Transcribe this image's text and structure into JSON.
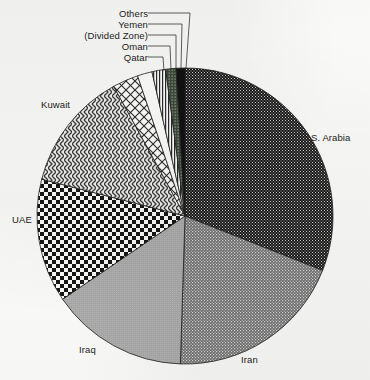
{
  "chart_data": {
    "type": "pie",
    "title": "",
    "subtitle": "",
    "xlabel": "",
    "ylabel": "",
    "legend_position": "none",
    "grid": false,
    "categories": [
      "S. Arabia",
      "Iran",
      "Iraq",
      "UAE",
      "Kuwait",
      "Qatar",
      "Oman",
      "(Divided Zone)",
      "Yemen",
      "Others"
    ],
    "values": [
      31.0,
      19.5,
      15.0,
      13.5,
      13.0,
      2.8,
      1.6,
      1.5,
      1.1,
      1.0
    ],
    "unit": "percent",
    "slices": [
      {
        "label": "S. Arabia",
        "value": 31.0,
        "start_angle": 0.0,
        "end_angle": 111.6,
        "fill": "black-fine-dot",
        "label_type": "outside",
        "label_x": 311,
        "label_y": 132
      },
      {
        "label": "Iran",
        "value": 19.5,
        "start_angle": 111.6,
        "end_angle": 181.8,
        "fill": "mid-grey-dot",
        "label_type": "outside",
        "label_x": 241,
        "label_y": 354
      },
      {
        "label": "Iraq",
        "value": 15.0,
        "start_angle": 181.8,
        "end_angle": 235.8,
        "fill": "light-grey-solid",
        "label_type": "outside",
        "label_x": 79,
        "label_y": 344
      },
      {
        "label": "UAE",
        "value": 13.5,
        "start_angle": 235.8,
        "end_angle": 284.4,
        "fill": "checkerboard",
        "label_type": "outside",
        "label_x": 12,
        "label_y": 214
      },
      {
        "label": "Kuwait",
        "value": 13.0,
        "start_angle": 284.4,
        "end_angle": 331.2,
        "fill": "diagonal-weave",
        "label_type": "outside",
        "label_x": 41,
        "label_y": 99
      },
      {
        "label": "Qatar",
        "value": 2.8,
        "start_angle": 331.2,
        "end_angle": 341.3,
        "fill": "white-crosshatch",
        "label_type": "callout",
        "label_x": 88,
        "label_y": 52
      },
      {
        "label": "Oman",
        "value": 1.6,
        "start_angle": 341.3,
        "end_angle": 347.1,
        "fill": "white-plain",
        "label_type": "callout",
        "label_x": 88,
        "label_y": 41
      },
      {
        "label": "(Divided Zone)",
        "value": 1.5,
        "start_angle": 347.1,
        "end_angle": 352.5,
        "fill": "vertical-stripe",
        "label_type": "callout",
        "label_x": 88,
        "label_y": 30
      },
      {
        "label": "Yemen",
        "value": 1.1,
        "start_angle": 352.5,
        "end_angle": 356.5,
        "fill": "dark-stipple",
        "label_type": "callout",
        "label_x": 88,
        "label_y": 19
      },
      {
        "label": "Others",
        "value": 1.0,
        "start_angle": 356.5,
        "end_angle": 360.0,
        "fill": "black-solid",
        "label_type": "callout",
        "label_x": 88,
        "label_y": 8
      }
    ],
    "geometry": {
      "center_x": 185,
      "center_y": 216,
      "radius": 148
    },
    "callout_lines": [
      {
        "label": "Others",
        "text_end_x": 148,
        "elbow_x": 190,
        "elbow_y": 13,
        "tip_x": 186,
        "tip_y": 68
      },
      {
        "label": "Yemen",
        "text_end_x": 148,
        "elbow_x": 182,
        "elbow_y": 24,
        "tip_x": 181,
        "tip_y": 68
      },
      {
        "label": "(Divided Zone)",
        "text_end_x": 148,
        "elbow_x": 176,
        "elbow_y": 35,
        "tip_x": 176,
        "tip_y": 69
      },
      {
        "label": "Oman",
        "text_end_x": 148,
        "elbow_x": 170,
        "elbow_y": 46,
        "tip_x": 171,
        "tip_y": 70
      },
      {
        "label": "Qatar",
        "text_end_x": 148,
        "elbow_x": 163,
        "elbow_y": 57,
        "tip_x": 164,
        "tip_y": 71
      }
    ]
  },
  "labels": {
    "s_arabia": "S. Arabia",
    "iran": "Iran",
    "iraq": "Iraq",
    "uae": "UAE",
    "kuwait": "Kuwait",
    "qatar": "Qatar",
    "oman": "Oman",
    "divided_zone": "(Divided Zone)",
    "yemen": "Yemen",
    "others": "Others"
  },
  "colors": {
    "ink": "#1c1c1c",
    "paper": "#fbfbf9",
    "slice_dark": "#1a1a1a",
    "slice_mid": "#8a8a8a",
    "slice_light": "#b9b9b9",
    "outline": "#222222"
  }
}
